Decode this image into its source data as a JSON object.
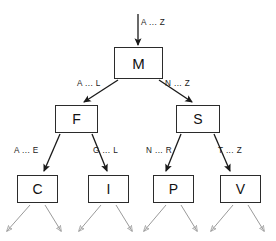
{
  "diagram": {
    "canvas": {
      "width": 276,
      "height": 241,
      "background": "#ffffff"
    },
    "colors": {
      "node_stroke": "#2b2b2b",
      "node_fill": "#ffffff",
      "edge_stroke": "#1a1a1a",
      "leaf_edge_stroke": "#9a9a9a",
      "text": "#111111"
    },
    "root_entry": {
      "label": "A ... Z",
      "target": "M"
    },
    "nodes": [
      {
        "id": "M",
        "label": "M",
        "level": 0,
        "x": 114,
        "y": 47,
        "w": 49,
        "h": 32,
        "font_size": 15
      },
      {
        "id": "F",
        "label": "F",
        "level": 1,
        "x": 55,
        "y": 105,
        "w": 43,
        "h": 28,
        "font_size": 14
      },
      {
        "id": "S",
        "label": "S",
        "level": 1,
        "x": 176,
        "y": 105,
        "w": 44,
        "h": 28,
        "font_size": 14
      },
      {
        "id": "C",
        "label": "C",
        "level": 2,
        "x": 17,
        "y": 175,
        "w": 41,
        "h": 28,
        "font_size": 14
      },
      {
        "id": "I",
        "label": "I",
        "level": 2,
        "x": 88,
        "y": 175,
        "w": 41,
        "h": 28,
        "font_size": 14
      },
      {
        "id": "P",
        "label": "P",
        "level": 2,
        "x": 153,
        "y": 175,
        "w": 41,
        "h": 28,
        "font_size": 14
      },
      {
        "id": "V",
        "label": "V",
        "level": 2,
        "x": 220,
        "y": 175,
        "w": 41,
        "h": 28,
        "font_size": 14
      }
    ],
    "edges": [
      {
        "id": "edge-root-M",
        "from": "entry",
        "to": "M",
        "label": "A ... Z",
        "label_x": 141,
        "label_y": 19
      },
      {
        "id": "edge-M-F",
        "from": "M",
        "to": "F",
        "label": "A ... L",
        "label_x": 77,
        "label_y": 80
      },
      {
        "id": "edge-M-S",
        "from": "M",
        "to": "S",
        "label": "N ... Z",
        "label_x": 165,
        "label_y": 80
      },
      {
        "id": "edge-F-C",
        "from": "F",
        "to": "C",
        "label": "A ... E",
        "label_x": 14,
        "label_y": 147
      },
      {
        "id": "edge-F-I",
        "from": "F",
        "to": "I",
        "label": "G ... L",
        "label_x": 93,
        "label_y": 147
      },
      {
        "id": "edge-S-P",
        "from": "S",
        "to": "P",
        "label": "N ... R",
        "label_x": 146,
        "label_y": 147
      },
      {
        "id": "edge-S-V",
        "from": "S",
        "to": "V",
        "label": "T ... Z",
        "label_x": 218,
        "label_y": 147
      }
    ],
    "leaf_arrows": [
      {
        "id": "leaf-arrow-C-left",
        "parent": "C",
        "x1": 30,
        "y1": 205,
        "x2": 6,
        "y2": 232
      },
      {
        "id": "leaf-arrow-C-right",
        "parent": "C",
        "x1": 45,
        "y1": 205,
        "x2": 62,
        "y2": 232
      },
      {
        "id": "leaf-arrow-I-left",
        "parent": "I",
        "x1": 101,
        "y1": 205,
        "x2": 78,
        "y2": 232
      },
      {
        "id": "leaf-arrow-I-right",
        "parent": "I",
        "x1": 116,
        "y1": 205,
        "x2": 133,
        "y2": 232
      },
      {
        "id": "leaf-arrow-P-left",
        "parent": "P",
        "x1": 166,
        "y1": 205,
        "x2": 143,
        "y2": 232
      },
      {
        "id": "leaf-arrow-P-right",
        "parent": "P",
        "x1": 181,
        "y1": 205,
        "x2": 198,
        "y2": 232
      },
      {
        "id": "leaf-arrow-V-left",
        "parent": "V",
        "x1": 233,
        "y1": 205,
        "x2": 210,
        "y2": 232
      },
      {
        "id": "leaf-arrow-V-right",
        "parent": "V",
        "x1": 248,
        "y1": 205,
        "x2": 265,
        "y2": 232
      }
    ]
  }
}
